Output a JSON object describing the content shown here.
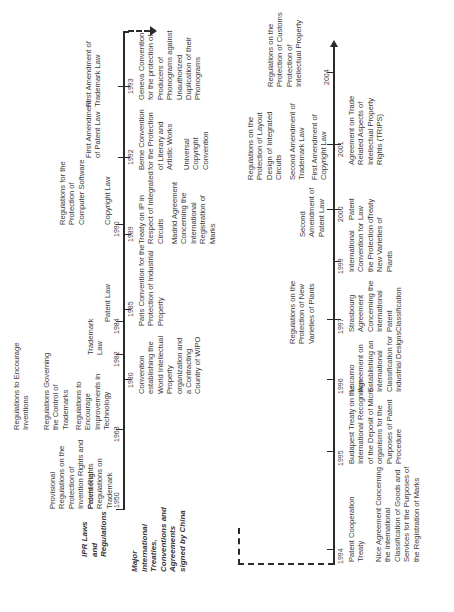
{
  "headers": {
    "ipr": "IPR Laws and Regulations",
    "treaties": "Major International Treaties, Conventions and Agreements signed by China"
  },
  "timeline_top": {
    "ipr": [
      {
        "year": "1950",
        "items": [
          "Provisional Regulations on the Protection of Invention Rights and Patent Rights",
          "Provisional Regulations on Trademark"
        ]
      },
      {
        "year": "1963",
        "items": [
          "Regulations to Encourage Inventions",
          "Regulations Governing the Control of Trademarks",
          "Regulations to Encourage Improvements in Technology"
        ]
      },
      {
        "year": "1982",
        "items": [
          "Trademark Law"
        ]
      },
      {
        "year": "1984",
        "items": [
          "Patent Law"
        ]
      },
      {
        "year": "1990",
        "items": [
          "Regulations for the Protection of Computer Software",
          "Copyright Law"
        ]
      },
      {
        "year": "1992",
        "items": [
          "First Amendment of Patent Law"
        ]
      },
      {
        "year": "1993",
        "items": [
          "First Amendment of Trademark Law"
        ]
      }
    ],
    "treaties": [
      {
        "year": "1980",
        "items": [
          "Convention establishing the World Intellectual Property organization and a Contracting Country of WIPO"
        ]
      },
      {
        "year": "1985",
        "items": [
          "Paris Convention for the Protection of Industrial Property"
        ]
      },
      {
        "year": "1989",
        "items": [
          "Treaty on IP in Respect of Integrated Circuits",
          "Madrid Agreement Concerning the International Registration of Marks"
        ]
      },
      {
        "year": "1992",
        "items": [
          "Berne Convention for the Protection of Literary and Artistic Works",
          "Universal Copyright Convention"
        ]
      },
      {
        "year": "1993",
        "items": [
          "Geneva Convention for the protection of Producers of Phonograms against Unauthorized Duplication of their Phonograms"
        ]
      }
    ]
  },
  "timeline_bottom": {
    "ipr": [
      {
        "year": "1997",
        "items": [
          "Regulations on the Protection of New Varieties of Plants"
        ]
      },
      {
        "year": "2000",
        "items": [
          "Second Amendment of Patent Law"
        ]
      },
      {
        "year": "2001",
        "items": [
          "Regulations on the Protection of Layout Design of Integrated Circuits",
          "Second Amendment of Trademark Law",
          "First Amendment of Copyright Law"
        ]
      },
      {
        "year": "2004",
        "items": [
          "Regulations on the Protection of Customs Protection of Intellectual Property"
        ]
      }
    ],
    "treaties": [
      {
        "year": "1994",
        "items": [
          "Patent Cooperation Treaty",
          "Nice Agreement Concerning the International Classification of Goods and Services for the Purposes of the Registration of Marks"
        ]
      },
      {
        "year": "1995",
        "items": [
          "Budapest Treaty on the International Recognition of the Deposit of Micro-organisms for the Purposes of Patent Procedure"
        ]
      },
      {
        "year": "1996",
        "items": [
          "Locarno Agreement on Establishing an International Classification for Industrial Designs"
        ]
      },
      {
        "year": "1997",
        "items": [
          "Strasbourg Agreement Concerning the International Patent Classification"
        ]
      },
      {
        "year": "1999",
        "items": [
          "International Convention for the Protection of New Varieties of Plants"
        ]
      },
      {
        "year": "2000",
        "items": [
          "Patent Law Treaty"
        ]
      },
      {
        "year": "2001",
        "items": [
          "Agreement on Trade Related Aspects of Intellectual Property Rights (TRIPS)"
        ]
      }
    ]
  }
}
